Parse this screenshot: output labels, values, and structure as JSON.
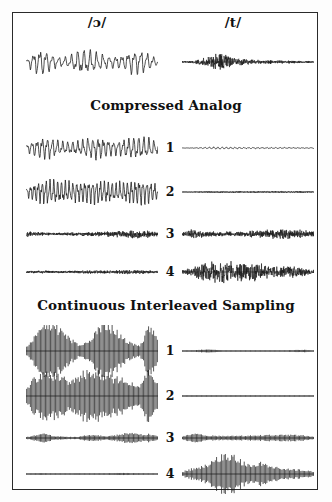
{
  "figure": {
    "background": "#ffffff",
    "frame_color": "#2a2a2a",
    "wave_color": "#151515",
    "width": 332,
    "height": 502
  },
  "column_headers": [
    {
      "label": "/ɔ/",
      "name": "phoneme-open-o"
    },
    {
      "label": "/t/",
      "name": "phoneme-t"
    }
  ],
  "sections": [
    {
      "id": "compressed-analog",
      "title": "Compressed Analog"
    },
    {
      "id": "continuous-interleaved-sampling",
      "title": "Continuous Interleaved Sampling"
    }
  ],
  "channel_numbers": [
    "1",
    "2",
    "3",
    "4"
  ],
  "chart_data": {
    "type": "line",
    "xlabel": "",
    "ylabel": "",
    "grid": false,
    "legend": "none",
    "columns": [
      "/ɔ/",
      "/t/"
    ],
    "panels": [
      {
        "panel": "input",
        "title": "",
        "rows": [
          {
            "channel": "",
            "traces": [
              {
                "column": "/ɔ/",
                "style": "analog",
                "width": 132,
                "height": 40,
                "amplitude": 0.92,
                "carrier_hz": 21,
                "jitter": 0.22,
                "envelope": [
                  0.15,
                  0.85,
                  0.95,
                  0.55,
                  0.35,
                  0.45,
                  0.9,
                  0.95,
                  0.75,
                  0.5,
                  0.45,
                  0.5,
                  0.85,
                  0.95,
                  0.6,
                  0.2
                ]
              },
              {
                "column": "/t/",
                "style": "noise",
                "width": 132,
                "height": 28,
                "amplitude": 0.78,
                "carrier_hz": 120,
                "jitter": 0.9,
                "envelope": [
                  0.08,
                  0.12,
                  0.3,
                  0.55,
                  1.0,
                  0.85,
                  0.45,
                  0.3,
                  0.28,
                  0.24,
                  0.2,
                  0.18,
                  0.16,
                  0.14,
                  0.12,
                  0.08
                ]
              }
            ]
          }
        ]
      },
      {
        "panel": "compressed-analog",
        "title": "Compressed Analog",
        "rows": [
          {
            "channel": "1",
            "traces": [
              {
                "column": "/ɔ/",
                "style": "analog",
                "width": 132,
                "height": 34,
                "amplitude": 0.95,
                "carrier_hz": 26,
                "jitter": 0.2,
                "envelope": [
                  0.3,
                  0.7,
                  0.95,
                  0.85,
                  0.55,
                  0.5,
                  0.65,
                  0.85,
                  0.95,
                  0.8,
                  0.6,
                  0.7,
                  0.9,
                  0.95,
                  0.85,
                  0.5
                ]
              },
              {
                "column": "/t/",
                "style": "analog",
                "width": 132,
                "height": 34,
                "amplitude": 0.13,
                "carrier_hz": 30,
                "jitter": 0.35,
                "envelope": [
                  0.1,
                  0.12,
                  0.25,
                  0.5,
                  0.7,
                  0.6,
                  0.5,
                  0.45,
                  0.4,
                  0.38,
                  0.36,
                  0.34,
                  0.32,
                  0.3,
                  0.28,
                  0.25
                ]
              }
            ]
          },
          {
            "channel": "2",
            "traces": [
              {
                "column": "/ɔ/",
                "style": "analog",
                "width": 132,
                "height": 34,
                "amplitude": 1.0,
                "carrier_hz": 34,
                "jitter": 0.18,
                "envelope": [
                  0.35,
                  0.75,
                  0.95,
                  1.0,
                  0.9,
                  0.8,
                  0.85,
                  0.95,
                  1.0,
                  0.9,
                  0.75,
                  0.8,
                  0.95,
                  1.0,
                  0.9,
                  0.6
                ]
              },
              {
                "column": "/t/",
                "style": "noise",
                "width": 132,
                "height": 34,
                "amplitude": 0.11,
                "carrier_hz": 80,
                "jitter": 0.7,
                "envelope": [
                  0.15,
                  0.2,
                  0.3,
                  0.4,
                  0.45,
                  0.42,
                  0.4,
                  0.4,
                  0.42,
                  0.44,
                  0.46,
                  0.48,
                  0.5,
                  0.5,
                  0.46,
                  0.3
                ]
              }
            ]
          },
          {
            "channel": "3",
            "traces": [
              {
                "column": "/ɔ/",
                "style": "noise",
                "width": 132,
                "height": 26,
                "amplitude": 0.42,
                "carrier_hz": 110,
                "jitter": 0.85,
                "envelope": [
                  0.65,
                  0.5,
                  0.35,
                  0.3,
                  0.3,
                  0.35,
                  0.4,
                  0.45,
                  0.5,
                  0.55,
                  0.65,
                  0.75,
                  0.85,
                  0.9,
                  0.8,
                  0.45
                ]
              },
              {
                "column": "/t/",
                "style": "noise",
                "width": 132,
                "height": 26,
                "amplitude": 0.5,
                "carrier_hz": 115,
                "jitter": 0.9,
                "envelope": [
                  0.3,
                  0.85,
                  0.7,
                  0.5,
                  0.45,
                  0.45,
                  0.5,
                  0.55,
                  0.6,
                  0.7,
                  0.85,
                  0.9,
                  0.95,
                  0.85,
                  0.7,
                  0.45
                ]
              }
            ]
          },
          {
            "channel": "4",
            "traces": [
              {
                "column": "/ɔ/",
                "style": "noise",
                "width": 132,
                "height": 28,
                "amplitude": 0.3,
                "carrier_hz": 120,
                "jitter": 0.95,
                "envelope": [
                  0.3,
                  0.35,
                  0.4,
                  0.35,
                  0.3,
                  0.35,
                  0.45,
                  0.5,
                  0.45,
                  0.4,
                  0.5,
                  0.6,
                  0.65,
                  0.6,
                  0.5,
                  0.3
                ]
              },
              {
                "column": "/t/",
                "style": "noise",
                "width": 132,
                "height": 28,
                "amplitude": 0.98,
                "carrier_hz": 120,
                "jitter": 0.95,
                "envelope": [
                  0.15,
                  0.35,
                  0.6,
                  0.8,
                  0.95,
                  1.0,
                  0.85,
                  0.7,
                  0.8,
                  0.7,
                  0.5,
                  0.45,
                  0.5,
                  0.45,
                  0.35,
                  0.2
                ]
              }
            ]
          }
        ]
      },
      {
        "panel": "continuous-interleaved-sampling",
        "title": "Continuous Interleaved Sampling",
        "rows": [
          {
            "channel": "1",
            "traces": [
              {
                "column": "/ɔ/",
                "style": "pulse",
                "width": 132,
                "height": 52,
                "amplitude": 1.0,
                "pulse_count": 105,
                "envelope": [
                  0.2,
                  0.55,
                  0.95,
                  1.0,
                  0.8,
                  0.45,
                  0.25,
                  0.3,
                  0.75,
                  1.0,
                  0.85,
                  0.55,
                  0.3,
                  0.2,
                  0.9,
                  0.55
                ]
              },
              {
                "column": "/t/",
                "style": "pulse",
                "width": 132,
                "height": 52,
                "amplitude": 0.2,
                "pulse_count": 105,
                "envelope": [
                  0.04,
                  0.06,
                  0.25,
                  0.3,
                  0.18,
                  0.1,
                  0.08,
                  0.07,
                  0.06,
                  0.06,
                  0.07,
                  0.08,
                  0.12,
                  0.2,
                  0.22,
                  0.1
                ]
              }
            ]
          },
          {
            "channel": "2",
            "traces": [
              {
                "column": "/ɔ/",
                "style": "pulse",
                "width": 132,
                "height": 52,
                "amplitude": 1.0,
                "pulse_count": 105,
                "envelope": [
                  0.3,
                  0.7,
                  0.95,
                  0.85,
                  0.7,
                  0.6,
                  0.75,
                  1.0,
                  0.9,
                  0.8,
                  0.7,
                  0.65,
                  0.5,
                  0.35,
                  0.95,
                  0.6
                ]
              },
              {
                "column": "/t/",
                "style": "pulse",
                "width": 132,
                "height": 52,
                "amplitude": 0.1,
                "pulse_count": 105,
                "envelope": [
                  0.05,
                  0.06,
                  0.07,
                  0.08,
                  0.09,
                  0.1,
                  0.1,
                  0.1,
                  0.1,
                  0.1,
                  0.1,
                  0.1,
                  0.1,
                  0.1,
                  0.09,
                  0.06
                ]
              }
            ]
          },
          {
            "channel": "3",
            "traces": [
              {
                "column": "/ɔ/",
                "style": "pulse",
                "width": 132,
                "height": 34,
                "amplitude": 0.45,
                "pulse_count": 105,
                "envelope": [
                  0.12,
                  0.35,
                  0.6,
                  0.3,
                  0.18,
                  0.15,
                  0.14,
                  0.45,
                  0.35,
                  0.25,
                  0.3,
                  0.55,
                  0.6,
                  0.45,
                  0.5,
                  0.25
                ]
              },
              {
                "column": "/t/",
                "style": "pulse",
                "width": 132,
                "height": 34,
                "amplitude": 0.42,
                "pulse_count": 105,
                "envelope": [
                  0.25,
                  0.6,
                  0.5,
                  0.35,
                  0.3,
                  0.28,
                  0.3,
                  0.32,
                  0.35,
                  0.38,
                  0.42,
                  0.45,
                  0.45,
                  0.4,
                  0.35,
                  0.2
                ]
              }
            ]
          },
          {
            "channel": "4",
            "traces": [
              {
                "column": "/ɔ/",
                "style": "pulse",
                "width": 132,
                "height": 40,
                "amplitude": 0.22,
                "pulse_count": 105,
                "envelope": [
                  0.1,
                  0.14,
                  0.18,
                  0.12,
                  0.1,
                  0.12,
                  0.16,
                  0.14,
                  0.12,
                  0.16,
                  0.2,
                  0.22,
                  0.2,
                  0.16,
                  0.14,
                  0.08
                ]
              },
              {
                "column": "/t/",
                "style": "pulse",
                "width": 132,
                "height": 40,
                "amplitude": 1.0,
                "pulse_count": 105,
                "envelope": [
                  0.12,
                  0.25,
                  0.35,
                  0.5,
                  0.8,
                  1.0,
                  0.85,
                  0.55,
                  0.45,
                  0.6,
                  0.4,
                  0.3,
                  0.25,
                  0.22,
                  0.2,
                  0.12
                ]
              }
            ]
          }
        ]
      }
    ]
  }
}
